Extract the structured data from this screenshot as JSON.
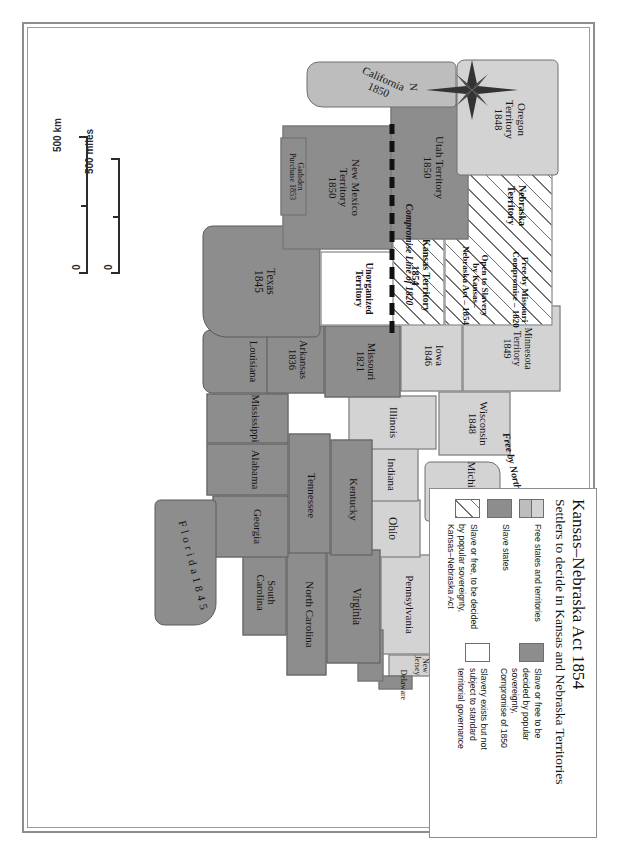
{
  "figure": {
    "kind": "historical-map",
    "orientation_note": "map rendered rotated 90 degrees clockwise"
  },
  "legend": {
    "title": "Kansas–Nebraska Act 1854",
    "subtitle": "Settlers to decide in Kansas and Nebraska Territories",
    "entries": [
      {
        "id": "free-states",
        "swatch": "split",
        "label": "Free states and territories"
      },
      {
        "id": "slave-states",
        "swatch": "dark",
        "label": "Slave states"
      },
      {
        "id": "popular-sovereignty",
        "swatch": "hatched",
        "label": "Slave or free, to be decided\nby popular sovereignty,\nKansas–Nebraska Act"
      },
      {
        "id": "compromise-1850",
        "swatch": "dark",
        "label": "Slave or free to be\ndecided by popular\nsovereignty,\nCompromise of 1850"
      },
      {
        "id": "unorganized",
        "swatch": "plain",
        "label": "Slavery exists but not\nsubject to standard\nterritorial governance"
      }
    ]
  },
  "compass": {
    "north_label": "N"
  },
  "scale": {
    "km": {
      "label": "500 km",
      "zero": "0"
    },
    "miles": {
      "label": "500 miles",
      "zero": "0"
    }
  },
  "colors": {
    "free_light": "#d3d3d3",
    "free_mid": "#bdbdbd",
    "slave": "#8d8d8d",
    "white": "#ffffff",
    "outline": "#6e6e6e",
    "frame": "#8d8d8d",
    "text": "#141414"
  },
  "map": {
    "annotations": [
      {
        "id": "compromise-line-1820",
        "label": "Compromise Line of 1820"
      },
      {
        "id": "northwest-ordinance",
        "label": "Free by Northwest Ordinance – 1820"
      },
      {
        "id": "missouri-compromise",
        "label": "Free by Missouri\nCompromise – 1820"
      },
      {
        "id": "open-to-slavery",
        "label": "Open to Slavery\nby Kansas–\nNebraska Act – 1854"
      }
    ],
    "places": [
      {
        "id": "maine",
        "name": "Maine",
        "year": "1820",
        "fill": "free_light"
      },
      {
        "id": "new-hampshire",
        "name": "N.H.",
        "year": "",
        "fill": "free_light"
      },
      {
        "id": "vermont",
        "name": "Vt.",
        "year": "",
        "fill": "free_light"
      },
      {
        "id": "massachusetts",
        "name": "Mass.",
        "year": "",
        "fill": "free_light"
      },
      {
        "id": "connecticut",
        "name": "Conn.",
        "year": "",
        "fill": "free_light"
      },
      {
        "id": "rhode-island",
        "name": "R.I.",
        "year": "",
        "fill": "free_light"
      },
      {
        "id": "new-york",
        "name": "New York",
        "year": "",
        "fill": "free_light"
      },
      {
        "id": "new-jersey",
        "name": "New\nJersey",
        "year": "",
        "fill": "free_light"
      },
      {
        "id": "pennsylvania",
        "name": "Pennsylvania",
        "year": "",
        "fill": "free_light"
      },
      {
        "id": "delaware",
        "name": "Delaware",
        "year": "",
        "fill": "slave"
      },
      {
        "id": "maryland",
        "name": "Md.",
        "year": "",
        "fill": "slave"
      },
      {
        "id": "ohio",
        "name": "Ohio",
        "year": "",
        "fill": "free_light"
      },
      {
        "id": "indiana",
        "name": "Indiana",
        "year": "",
        "fill": "free_light"
      },
      {
        "id": "illinois",
        "name": "Illinois",
        "year": "",
        "fill": "free_light"
      },
      {
        "id": "michigan",
        "name": "Michigan",
        "year": "1837",
        "fill": "free_light"
      },
      {
        "id": "wisconsin",
        "name": "Wisconsin",
        "year": "1848",
        "fill": "free_light"
      },
      {
        "id": "iowa",
        "name": "Iowa",
        "year": "1846",
        "fill": "free_light"
      },
      {
        "id": "minnesota-territory",
        "name": "Minnesota\nTerritory",
        "year": "1849",
        "fill": "free_light"
      },
      {
        "id": "virginia",
        "name": "Virginia",
        "year": "",
        "fill": "slave"
      },
      {
        "id": "north-carolina",
        "name": "North Carolina",
        "year": "",
        "fill": "slave"
      },
      {
        "id": "south-carolina",
        "name": "South\nCarolina",
        "year": "",
        "fill": "slave"
      },
      {
        "id": "georgia",
        "name": "Georgia",
        "year": "",
        "fill": "slave"
      },
      {
        "id": "florida",
        "name": "F l o r i d a",
        "year": "1 8 4 5",
        "fill": "slave"
      },
      {
        "id": "alabama",
        "name": "Alabama",
        "year": "",
        "fill": "slave"
      },
      {
        "id": "mississippi",
        "name": "Mississippi",
        "year": "",
        "fill": "slave"
      },
      {
        "id": "louisiana",
        "name": "Louisiana",
        "year": "",
        "fill": "slave"
      },
      {
        "id": "tennessee",
        "name": "Tennessee",
        "year": "",
        "fill": "slave"
      },
      {
        "id": "kentucky",
        "name": "Kentucky",
        "year": "",
        "fill": "slave"
      },
      {
        "id": "missouri",
        "name": "Missouri",
        "year": "1821",
        "fill": "slave"
      },
      {
        "id": "arkansas",
        "name": "Arkansas",
        "year": "1836",
        "fill": "slave"
      },
      {
        "id": "texas",
        "name": "Texas",
        "year": "1845",
        "fill": "slave"
      },
      {
        "id": "unorganized-territory",
        "name": "Unorganized\nTerritory",
        "year": "",
        "fill": "white"
      },
      {
        "id": "kansas-territory",
        "name": "Kansas Territory",
        "year": "1854",
        "fill": "hatched"
      },
      {
        "id": "nebraska-territory",
        "name": "Nebraska\nTerritory",
        "year": "",
        "fill": "hatched"
      },
      {
        "id": "new-mexico-territory",
        "name": "New Mexico\nTerritory",
        "year": "1850",
        "fill": "slave"
      },
      {
        "id": "utah-territory",
        "name": "Utah Territory",
        "year": "1850",
        "fill": "slave"
      },
      {
        "id": "california",
        "name": "California",
        "year": "1850",
        "fill": "free_mid"
      },
      {
        "id": "oregon-territory",
        "name": "Oregon\nTerritory",
        "year": "1848",
        "fill": "free_light"
      },
      {
        "id": "gadsden-purchase",
        "name": "Gadsden\nPurchase",
        "year": "1853",
        "fill": "slave"
      }
    ]
  }
}
